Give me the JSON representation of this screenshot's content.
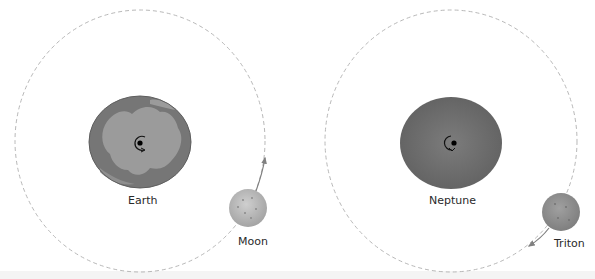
{
  "panels": [
    {
      "planet": {
        "label": "Earth",
        "fill": "#7a7a7a",
        "land": "#9a9a9a"
      },
      "moon": {
        "label": "Moon",
        "fill": "#b8b8b8"
      },
      "orbit_direction": "counterclockwise"
    },
    {
      "planet": {
        "label": "Neptune",
        "fill": "#6e6e6e"
      },
      "moon": {
        "label": "Triton",
        "fill": "#8f8f8f"
      },
      "orbit_direction": "clockwise"
    }
  ],
  "colors": {
    "orbit": "#b5b5b5",
    "arrow": "#808080",
    "background": "#ffffff"
  }
}
